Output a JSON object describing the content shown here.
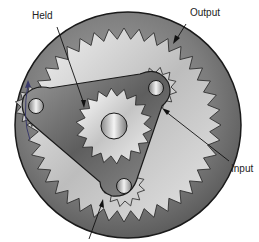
{
  "diagram": {
    "type": "planetary-gear-set",
    "labels": {
      "held": "Held",
      "output": "Output",
      "input": "Input"
    },
    "components": [
      {
        "name": "ring-gear",
        "role": "output"
      },
      {
        "name": "sun-gear",
        "role": "held"
      },
      {
        "name": "planet-carrier",
        "role": "input"
      },
      {
        "name": "planet-gears",
        "count": 3
      }
    ],
    "colors": {
      "ring": "#6b6b6b",
      "ring_inner": "#d9d9d9",
      "carrier": "#7a7a7a",
      "sun": "#e8e8e8",
      "line": "#1a1a1a"
    }
  }
}
